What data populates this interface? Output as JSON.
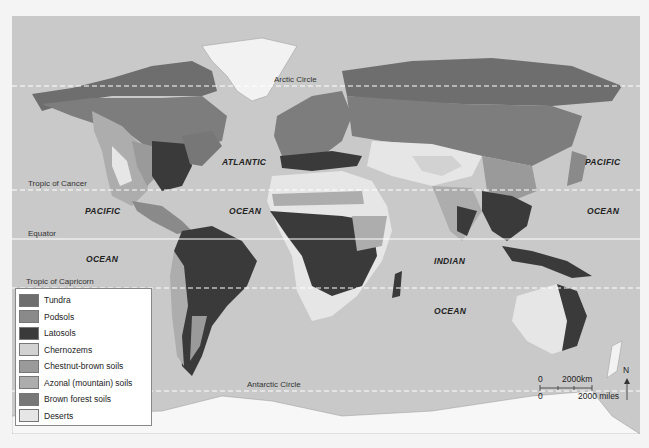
{
  "map": {
    "title": "World soil types",
    "latitude_lines": [
      {
        "name": "Arctic Circle",
        "label": "Arctic Circle"
      },
      {
        "name": "Tropic of Cancer",
        "label": "Tropic of Cancer"
      },
      {
        "name": "Equator",
        "label": "Equator"
      },
      {
        "name": "Tropic of Capricorn",
        "label": "Tropic of Capricorn"
      },
      {
        "name": "Antarctic Circle",
        "label": "Antarctic Circle"
      }
    ],
    "ocean_labels": [
      {
        "label": "ATLANTIC"
      },
      {
        "label": "OCEAN"
      },
      {
        "label": "PACIFIC"
      },
      {
        "label": "OCEAN"
      },
      {
        "label": "PACIFIC"
      },
      {
        "label": "OCEAN"
      },
      {
        "label": "INDIAN"
      },
      {
        "label": "OCEAN"
      }
    ]
  },
  "legend": {
    "items": [
      {
        "label": "Tundra",
        "color": "#6e6e6e"
      },
      {
        "label": "Podsols",
        "color": "#8a8a8a"
      },
      {
        "label": "Latosols",
        "color": "#3a3a3a"
      },
      {
        "label": "Chernozems",
        "color": "#d2d2d2"
      },
      {
        "label": "Chestnut-brown soils",
        "color": "#9a9a9a"
      },
      {
        "label": "Azonal (mountain) soils",
        "color": "#adadad"
      },
      {
        "label": "Brown forest soils",
        "color": "#777777"
      },
      {
        "label": "Deserts",
        "color": "#e6e6e6"
      }
    ]
  },
  "scale": {
    "km_zero": "0",
    "km_label": "2000km",
    "mi_zero": "0",
    "mi_label": "2000 miles",
    "north_label": "N"
  }
}
